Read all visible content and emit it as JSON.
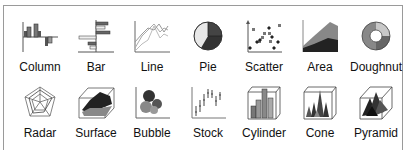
{
  "chart_types": [
    {
      "id": "column",
      "label": "Column",
      "icon": "column-chart-icon"
    },
    {
      "id": "bar",
      "label": "Bar",
      "icon": "bar-chart-icon"
    },
    {
      "id": "line",
      "label": "Line",
      "icon": "line-chart-icon"
    },
    {
      "id": "pie",
      "label": "Pie",
      "icon": "pie-chart-icon"
    },
    {
      "id": "scatter",
      "label": "Scatter",
      "icon": "scatter-chart-icon"
    },
    {
      "id": "area",
      "label": "Area",
      "icon": "area-chart-icon"
    },
    {
      "id": "doughnut",
      "label": "Doughnut",
      "icon": "doughnut-chart-icon"
    },
    {
      "id": "radar",
      "label": "Radar",
      "icon": "radar-chart-icon"
    },
    {
      "id": "surface",
      "label": "Surface",
      "icon": "surface-chart-icon"
    },
    {
      "id": "bubble",
      "label": "Bubble",
      "icon": "bubble-chart-icon"
    },
    {
      "id": "stock",
      "label": "Stock",
      "icon": "stock-chart-icon"
    },
    {
      "id": "cylinder",
      "label": "Cylinder",
      "icon": "cylinder-chart-icon"
    },
    {
      "id": "cone",
      "label": "Cone",
      "icon": "cone-chart-icon"
    },
    {
      "id": "pyramid",
      "label": "Pyramid",
      "icon": "pyramid-chart-icon"
    }
  ],
  "colors": {
    "border": "#9a9a9a",
    "dark": "#333333",
    "mid": "#777777",
    "light": "#c8c8c8",
    "text": "#111111"
  }
}
